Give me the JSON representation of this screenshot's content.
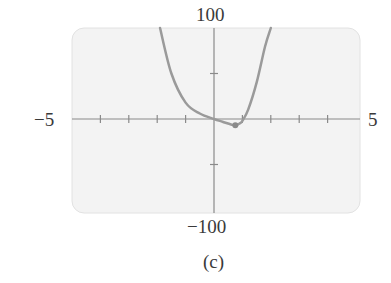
{
  "figure": {
    "caption": "(c)",
    "labels": {
      "y_max": "100",
      "y_min": "−100",
      "x_min": "−5",
      "x_max": "5"
    }
  },
  "chart_data": {
    "type": "line",
    "title": "",
    "xlabel": "",
    "ylabel": "",
    "xlim": [
      -5,
      5
    ],
    "ylim": [
      -100,
      100
    ],
    "x_ticks": [
      -4,
      -3,
      -2,
      -1,
      1,
      2,
      3,
      4
    ],
    "y_ticks": [
      -50,
      50
    ],
    "grid": false,
    "legend": null,
    "series": [
      {
        "name": "curve",
        "color": "#9a9a9a",
        "x": [
          -1.9,
          -1.5,
          -1.0,
          -0.5,
          0,
          0.3,
          0.6,
          0.75,
          0.9,
          1.0,
          1.2,
          1.5,
          1.8,
          2.0
        ],
        "y": [
          100,
          50,
          18,
          6,
          0,
          -3,
          -6,
          -7,
          -5,
          -2,
          10,
          40,
          80,
          100
        ]
      }
    ],
    "annotations": [
      {
        "type": "point",
        "x": 0.75,
        "y": -7,
        "label": "local minimum"
      }
    ],
    "caption": "(c)"
  }
}
